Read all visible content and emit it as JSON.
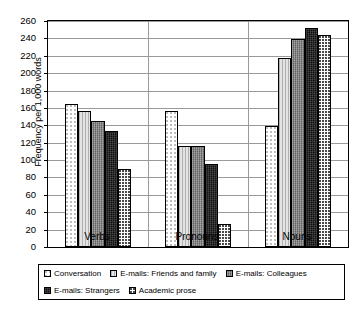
{
  "chart_data": {
    "type": "bar",
    "title": "",
    "subtitle": "",
    "xlabel": "",
    "ylabel": "Frequency per 1,000 words",
    "categories": [
      "Verbs",
      "Pronouns",
      "Nouns"
    ],
    "series": [
      {
        "name": "Conversation",
        "values": [
          165,
          157,
          139
        ]
      },
      {
        "name": "E-mails: Friends and family",
        "values": [
          157,
          116,
          217
        ]
      },
      {
        "name": "E-mails: Colleagues",
        "values": [
          145,
          116,
          239
        ]
      },
      {
        "name": "E-mails: Strangers",
        "values": [
          134,
          95,
          252
        ]
      },
      {
        "name": "Academic prose",
        "values": [
          90,
          27,
          244
        ]
      }
    ],
    "ylim": [
      0,
      260
    ],
    "ytick_step": 20,
    "yticks": [
      0,
      20,
      40,
      60,
      80,
      100,
      120,
      140,
      160,
      180,
      200,
      220,
      240,
      260
    ],
    "grid": true,
    "legend_position": "bottom"
  },
  "legend": {
    "items": [
      {
        "label": "Conversation",
        "swatch": "pattern-sparse-dots"
      },
      {
        "label": "E-mails: Friends and family",
        "swatch": "pattern-vertical-lines"
      },
      {
        "label": "E-mails: Colleagues",
        "swatch": "pattern-grey-hatch"
      },
      {
        "label": "E-mails: Strangers",
        "swatch": "pattern-black"
      },
      {
        "label": "Academic prose",
        "swatch": "pattern-dense-dots"
      }
    ]
  }
}
